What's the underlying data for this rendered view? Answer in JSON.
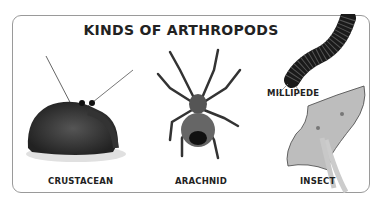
{
  "title": "KINDS OF ARTHROPODS",
  "items": [
    {
      "label": "CRUSTACEAN",
      "image": "hermit-crab"
    },
    {
      "label": "ARACHNID",
      "image": "spider"
    },
    {
      "label": "MILLIPEDE",
      "image": "millipede"
    },
    {
      "label": "INSECT",
      "image": "luna-moth"
    }
  ]
}
